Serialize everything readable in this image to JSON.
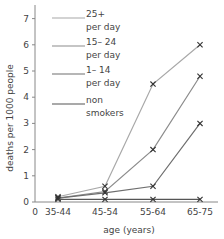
{
  "chart_data": {
    "type": "line",
    "title": "",
    "xlabel": "age (years)",
    "ylabel": "deaths per 1000 people",
    "categories": [
      "35-44",
      "45-54",
      "55-64",
      "65-75"
    ],
    "x_origin_label": "0",
    "ylim": [
      0,
      7
    ],
    "yticks": [
      0,
      1,
      2,
      3,
      4,
      5,
      6,
      7
    ],
    "grid": false,
    "legend_position": "upper-left-inside",
    "marker": "x",
    "series": [
      {
        "name": "25+ per day",
        "label_lines": [
          "25+",
          "per day"
        ],
        "color": "#a8a8a8",
        "values": [
          0.2,
          0.6,
          4.5,
          6.0
        ]
      },
      {
        "name": "15-24 per day",
        "label_lines": [
          "15– 24",
          "per day"
        ],
        "color": "#8c8c8c",
        "values": [
          0.15,
          0.4,
          2.0,
          4.8
        ]
      },
      {
        "name": "1-14 per day",
        "label_lines": [
          "1– 14",
          "per day"
        ],
        "color": "#6e6e6e",
        "values": [
          0.15,
          0.35,
          0.6,
          3.0
        ]
      },
      {
        "name": "non smokers",
        "label_lines": [
          "non",
          "smokers"
        ],
        "color": "#555555",
        "values": [
          0.1,
          0.1,
          0.1,
          0.1
        ]
      }
    ]
  }
}
